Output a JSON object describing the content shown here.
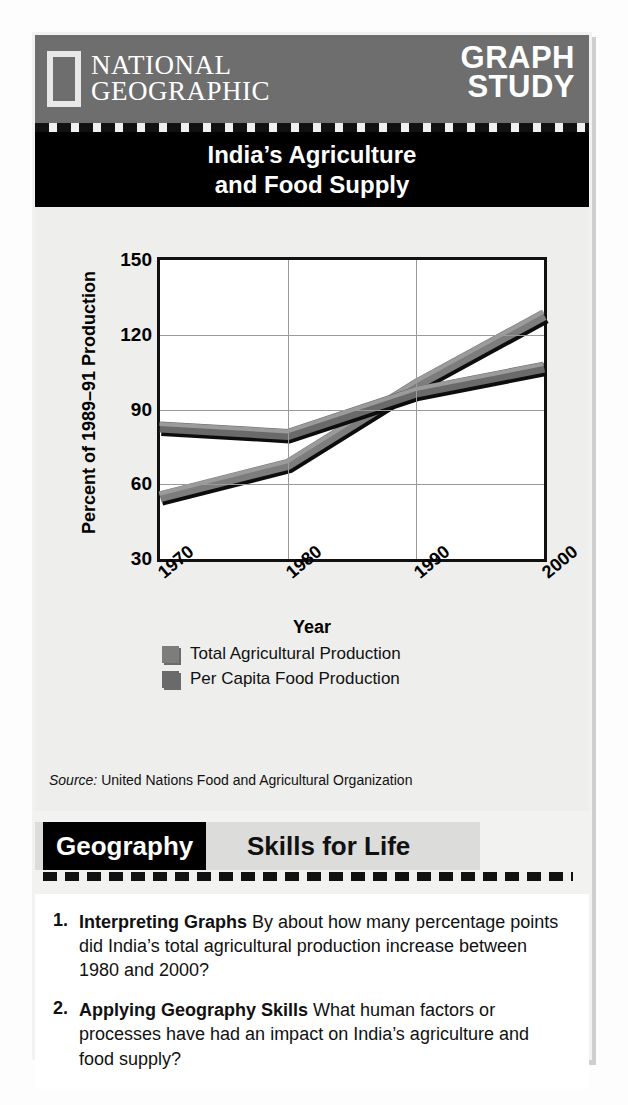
{
  "header": {
    "brand_line1": "NATIONAL",
    "brand_line2": "GEOGRAPHIC",
    "feature_line1": "GRAPH",
    "feature_line2": "STUDY",
    "logo_icon": "ng-yellow-rectangle-icon"
  },
  "chart_title": {
    "line1": "India’s Agriculture",
    "line2": "and Food Supply"
  },
  "source": {
    "label": "Source:",
    "text": "United Nations Food and Agricultural Organization"
  },
  "geography_bar": {
    "black_label": "Geography",
    "grey_label": "Skills for Life"
  },
  "questions": [
    {
      "number": "1.",
      "bold": "Interpreting Graphs",
      "text": "By about how many percentage points did India’s total agricultural production increase between 1980 and 2000?"
    },
    {
      "number": "2.",
      "bold": "Applying Geography Skills",
      "text": "What human factors or processes have had an impact on India’s agriculture and food supply?"
    }
  ],
  "colors": {
    "header_grey": "#6e6e6e",
    "title_black": "#000000",
    "panel_grey": "#eeeeec",
    "series_total": "#7d7d7d",
    "series_percapita": "#6a6a6a"
  },
  "chart_data": {
    "type": "line",
    "title": "India’s Agriculture and Food Supply",
    "xlabel": "Year",
    "ylabel": "Percent of 1989–91 Production",
    "x": [
      1970,
      1980,
      1990,
      2000
    ],
    "xticklabels": [
      "1970",
      "1980",
      "1990",
      "2000"
    ],
    "yticklabels": [
      "30",
      "60",
      "90",
      "120",
      "150"
    ],
    "yticks": [
      30,
      60,
      90,
      120,
      150
    ],
    "ylim": [
      30,
      150
    ],
    "xlim": [
      1970,
      2000
    ],
    "grid": true,
    "legend_position": "below-axis",
    "series": [
      {
        "name": "Total Agricultural Production",
        "color": "#7d7d7d",
        "values": [
          55,
          68,
          100,
          128
        ]
      },
      {
        "name": "Per Capita Food Production",
        "color": "#6a6a6a",
        "values": [
          83,
          80,
          97,
          107
        ]
      }
    ]
  }
}
